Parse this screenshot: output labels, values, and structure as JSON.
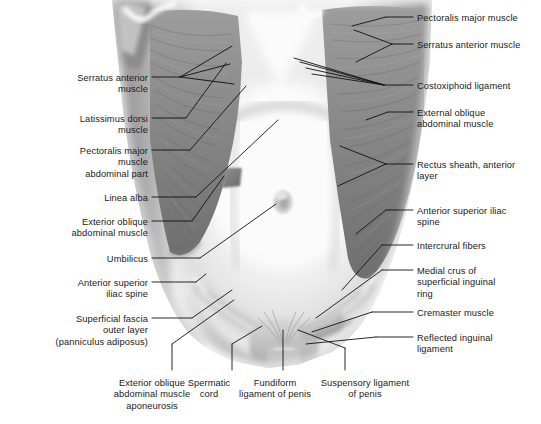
{
  "figure": {
    "background_color": "#ffffff",
    "leader_color": "#111111",
    "text_color": "#1a1a1a",
    "width": 541,
    "height": 424
  },
  "labels_left": [
    {
      "text": "Serratus anterior\nmuscle",
      "x": 148,
      "y": 73
    },
    {
      "text": "Latissimus dorsi\nmuscle",
      "x": 148,
      "y": 114
    },
    {
      "text": "Pectoralis major\nmuscle\nabdominal part",
      "x": 148,
      "y": 146
    },
    {
      "text": "Linea alba",
      "x": 148,
      "y": 193
    },
    {
      "text": "Exterior oblique\nabdominal muscle",
      "x": 148,
      "y": 217
    },
    {
      "text": "Umbilicus",
      "x": 148,
      "y": 254
    },
    {
      "text": "Anterior superior\niliac spine",
      "x": 148,
      "y": 278
    },
    {
      "text": "Superficial fascia\nouter layer\n(panniculus adiposus)",
      "x": 148,
      "y": 314
    }
  ],
  "labels_right": [
    {
      "text": "Pectoralis major muscle",
      "x": 417,
      "y": 13
    },
    {
      "text": "Serratus anterior muscle",
      "x": 417,
      "y": 40
    },
    {
      "text": "Costoxiphoid ligament",
      "x": 417,
      "y": 81
    },
    {
      "text": "External oblique\nabdominal muscle",
      "x": 417,
      "y": 108
    },
    {
      "text": "Rectus sheath, anterior\nlayer",
      "x": 417,
      "y": 160
    },
    {
      "text": "Anterior superior iliac\nspine",
      "x": 417,
      "y": 206
    },
    {
      "text": "Intercrural fibers",
      "x": 417,
      "y": 241
    },
    {
      "text": "Medial crus of\nsuperficial inguinal\nring",
      "x": 417,
      "y": 266
    },
    {
      "text": "Cremaster muscle",
      "x": 417,
      "y": 308
    },
    {
      "text": "Reflected inguinal\nligament",
      "x": 417,
      "y": 333
    }
  ],
  "labels_bottom": [
    {
      "text": "Exterior oblique\nabdominal muscle\naponeurosis",
      "x": 152,
      "y": 378
    },
    {
      "text": "Spermatic\ncord",
      "x": 209,
      "y": 378
    },
    {
      "text": "Fundiform\nligament of penis",
      "x": 275,
      "y": 378
    },
    {
      "text": "Suspensory ligament\nof penis",
      "x": 365,
      "y": 378
    }
  ]
}
